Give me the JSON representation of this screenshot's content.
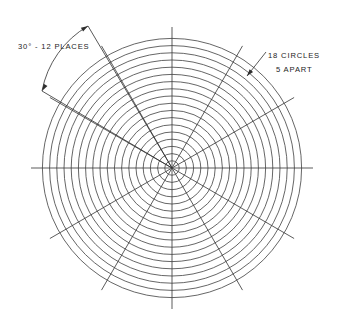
{
  "drawing": {
    "title": "Polar Grid Layout Drawing",
    "background_color": "#ffffff",
    "line_color": "#4a4a4a",
    "text_color": "#1c1c1c",
    "width": 337,
    "height": 328
  },
  "geometry": {
    "center_x": 172,
    "center_y": 168,
    "circle_count": 18,
    "circle_spacing_px": 7.2,
    "outer_radius_px": 130,
    "inner_radius_px": 7.2,
    "spoke_count": 12,
    "spoke_angle_step_deg": 30,
    "spoke_radius_px": 141,
    "spoke_angles_deg": [
      0,
      30,
      60,
      90,
      120,
      150,
      180,
      210,
      240,
      270,
      300,
      330
    ]
  },
  "annotations": {
    "angle_note": {
      "label": "30° - 12 PLACES",
      "text_x": 18,
      "text_y": 47,
      "dim_vertex_x": 172,
      "dim_vertex_y": 168,
      "arrow_a_x": 88,
      "arrow_a_y": 26,
      "arrow_b_x": 42,
      "arrow_b_y": 91,
      "arc_radius_px": 96
    },
    "circles_note": {
      "line1": "18 CIRCLES",
      "line2": "5 APART",
      "line1_x": 268,
      "line1_y": 56,
      "line2_x": 276,
      "line2_y": 70,
      "leader_start_x": 266,
      "leader_start_y": 52,
      "leader_end_x": 247,
      "leader_end_y": 76,
      "arrow_target_x": 247,
      "arrow_target_y": 76
    }
  }
}
